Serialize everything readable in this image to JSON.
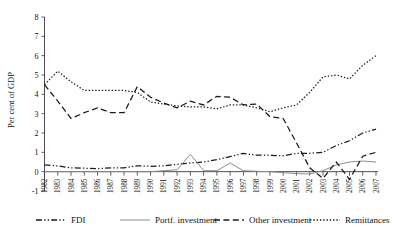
{
  "chart_data": {
    "type": "line",
    "title": "",
    "xlabel": "",
    "ylabel": "Per cent of GDP",
    "ylim": [
      -1,
      8
    ],
    "yticks": [
      -1,
      0,
      1,
      2,
      3,
      4,
      5,
      6,
      7,
      8
    ],
    "ytick_labels": [
      "-1",
      "0",
      "1",
      "2",
      "3",
      "4",
      "5",
      "6",
      "7",
      "8"
    ],
    "grid": false,
    "legend_position": "bottom",
    "x": [
      1982,
      1983,
      1984,
      1985,
      1986,
      1987,
      1988,
      1989,
      1990,
      1991,
      1992,
      1993,
      1994,
      1995,
      1996,
      1997,
      1998,
      1999,
      2000,
      2001,
      2002,
      2003,
      2004,
      2005,
      2006,
      2007
    ],
    "xtick_labels": [
      "1982",
      "1983",
      "1984",
      "1985",
      "1986",
      "1987",
      "1988",
      "1989",
      "1990",
      "1991",
      "1992",
      "1993",
      "1994",
      "1995",
      "1996",
      "1997",
      "1998",
      "1999",
      "2000",
      "2001",
      "2002",
      "2003",
      "2004",
      "2005",
      "2006",
      "2007"
    ],
    "series": [
      {
        "name": "FDI",
        "style": "dash-dot-dot",
        "color": "#1a1a1a",
        "values": [
          0.35,
          0.3,
          0.2,
          0.18,
          0.16,
          0.2,
          0.2,
          0.3,
          0.28,
          0.3,
          0.38,
          0.45,
          0.5,
          0.62,
          0.78,
          0.95,
          0.85,
          0.85,
          0.82,
          0.95,
          0.95,
          1.0,
          1.35,
          1.6,
          2.0,
          2.2
        ]
      },
      {
        "name": "Portf. investment",
        "style": "solid",
        "color": "#8c8c8c",
        "values": [
          0.0,
          0.0,
          0.0,
          0.0,
          0.0,
          0.0,
          0.0,
          0.0,
          0.0,
          0.05,
          0.1,
          0.9,
          0.05,
          0.05,
          0.45,
          0.05,
          0.02,
          0.0,
          -0.05,
          -0.1,
          -0.12,
          0.05,
          0.35,
          0.5,
          0.55,
          0.5
        ]
      },
      {
        "name": "Other investment",
        "style": "dashed",
        "color": "#1a1a1a",
        "values": [
          4.5,
          3.65,
          2.75,
          3.05,
          3.3,
          3.05,
          3.05,
          4.4,
          3.85,
          3.55,
          3.3,
          3.65,
          3.45,
          3.9,
          3.85,
          3.45,
          3.5,
          2.85,
          2.75,
          1.5,
          0.2,
          -0.35,
          0.5,
          -0.4,
          0.8,
          1.0
        ]
      },
      {
        "name": "Remittances",
        "style": "dotted",
        "color": "#1a1a1a",
        "values": [
          4.5,
          5.2,
          4.65,
          4.2,
          4.2,
          4.2,
          4.2,
          4.1,
          3.6,
          3.5,
          3.4,
          3.35,
          3.35,
          3.25,
          3.45,
          3.45,
          3.3,
          3.1,
          3.3,
          3.45,
          4.1,
          4.9,
          5.0,
          4.8,
          5.5,
          6.0
        ]
      }
    ],
    "legend": [
      {
        "label": "FDI",
        "style": "dash-dot-dot",
        "color": "#1a1a1a"
      },
      {
        "label": "Portf. investment",
        "style": "solid",
        "color": "#8c8c8c"
      },
      {
        "label": "Other investment",
        "style": "dashed",
        "color": "#1a1a1a"
      },
      {
        "label": "Remittances",
        "style": "dotted",
        "color": "#1a1a1a"
      }
    ]
  }
}
